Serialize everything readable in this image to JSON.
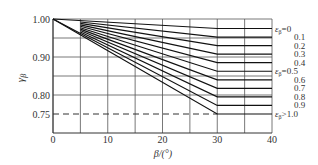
{
  "chart_data": {
    "type": "line",
    "title": "",
    "xlabel": "β/(°)",
    "ylabel": "γβ",
    "xlim": [
      0,
      40
    ],
    "ylim": [
      0.7,
      1.0
    ],
    "x_ticks": [
      "0",
      "10",
      "20",
      "30",
      "40"
    ],
    "y_ticks": [
      "1.00",
      "0.90",
      "0.80",
      "0.75"
    ],
    "grid": true,
    "legend_position": "right (labels at line ends)",
    "series": [
      {
        "name": "εβ=0",
        "x": [
          0,
          30,
          40
        ],
        "values": [
          1.0,
          0.975,
          0.975
        ]
      },
      {
        "name": "0.1",
        "x": [
          0,
          30,
          40
        ],
        "values": [
          1.0,
          0.9525,
          0.9525
        ]
      },
      {
        "name": "0.2",
        "x": [
          0,
          30,
          40
        ],
        "values": [
          1.0,
          0.93,
          0.93
        ]
      },
      {
        "name": "0.3",
        "x": [
          0,
          30,
          40
        ],
        "values": [
          1.0,
          0.9075,
          0.9075
        ]
      },
      {
        "name": "0.4",
        "x": [
          0,
          30,
          40
        ],
        "values": [
          1.0,
          0.885,
          0.885
        ]
      },
      {
        "name": "εβ=0.5",
        "x": [
          0,
          30,
          40
        ],
        "values": [
          1.0,
          0.8625,
          0.8625
        ]
      },
      {
        "name": "0.6",
        "x": [
          0,
          30,
          40
        ],
        "values": [
          1.0,
          0.84,
          0.84
        ]
      },
      {
        "name": "0.7",
        "x": [
          0,
          30,
          40
        ],
        "values": [
          1.0,
          0.8175,
          0.8175
        ]
      },
      {
        "name": "0.8",
        "x": [
          0,
          30,
          40
        ],
        "values": [
          1.0,
          0.795,
          0.795
        ]
      },
      {
        "name": "0.9",
        "x": [
          0,
          30,
          40
        ],
        "values": [
          1.0,
          0.7725,
          0.7725
        ]
      },
      {
        "name": "εβ>1.0",
        "x": [
          0,
          30,
          40
        ],
        "values": [
          1.0,
          0.75,
          0.75
        ]
      }
    ],
    "annotations": [
      {
        "type": "dashed-hline",
        "y": 0.75,
        "x_range": [
          0,
          30
        ]
      }
    ]
  },
  "axis": {
    "ylabel_main": "γ",
    "ylabel_sub": "β",
    "xlabel": "β/(°)"
  }
}
